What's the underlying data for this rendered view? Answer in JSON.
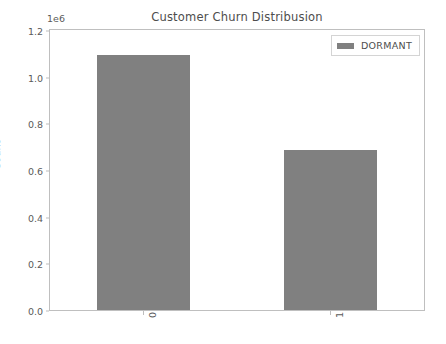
{
  "chart_data": {
    "type": "bar",
    "title": "Customer Churn Distribusion",
    "xlabel": "",
    "ylabel": "Count",
    "categories": [
      "0",
      "1"
    ],
    "values": [
      1146000,
      720000
    ],
    "series": [
      {
        "name": "DORMANT",
        "values": [
          1146000,
          720000
        ]
      }
    ],
    "ylim": [
      0,
      1260000
    ],
    "y_offset_text": "1e6",
    "y_ticks": [
      0,
      200000,
      400000,
      600000,
      800000,
      1000000,
      1200000
    ],
    "y_tick_labels": [
      "0.0",
      "0.2",
      "0.4",
      "0.6",
      "0.8",
      "1.0",
      "1.2"
    ],
    "x_tick_labels": [
      "0",
      "1"
    ],
    "x_tick_label_rotation": 90,
    "grid": false,
    "legend": {
      "position": "upper right",
      "entries": [
        {
          "label": "DORMANT",
          "color": "#808080"
        }
      ]
    },
    "colors": {
      "bar": "#808080",
      "axis": "#bfbfbf",
      "text": "#5a5a5a",
      "title": "#4d4d4d",
      "background": "#ffffff"
    }
  }
}
